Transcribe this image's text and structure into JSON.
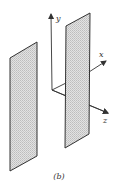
{
  "figure": {
    "caption": "(b)",
    "colors": {
      "background": "#ffffff",
      "stroke": "#333333",
      "panel_fill": "#d9d9d9",
      "panel_stipple": "#bdbdbd"
    },
    "axes": {
      "origin": [
        52,
        90
      ],
      "y": {
        "label": "y",
        "end": [
          51,
          14
        ],
        "label_pos": [
          57,
          20
        ]
      },
      "x": {
        "label": "x",
        "end": [
          106,
          61
        ],
        "label_pos": [
          100,
          56
        ]
      },
      "z": {
        "label": "z",
        "end": [
          108,
          113
        ],
        "label_pos": [
          103,
          123
        ]
      }
    },
    "panels": [
      {
        "name": "left-sheet",
        "points": "10,58 37,42 37,156 10,171"
      },
      {
        "name": "right-sheet",
        "points": "66,26 90,13 89,134 65,148"
      }
    ]
  }
}
